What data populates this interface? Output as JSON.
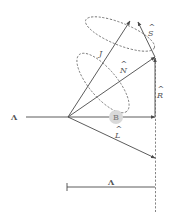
{
  "diagram": {
    "labels": {
      "axis_left": "Λ",
      "J": "J",
      "S": "S",
      "N": "N",
      "R": "R",
      "B": "B",
      "L": "L",
      "lambda": "Λ"
    },
    "hats": {
      "J": "^",
      "S": "^",
      "N": "^",
      "R": "^",
      "L": "^"
    },
    "colors": {
      "line": "#4a4a4a",
      "dash": "#666666",
      "text": "#555555",
      "badge_fill": "#d9d9d9",
      "badge_text": "#777777"
    }
  }
}
